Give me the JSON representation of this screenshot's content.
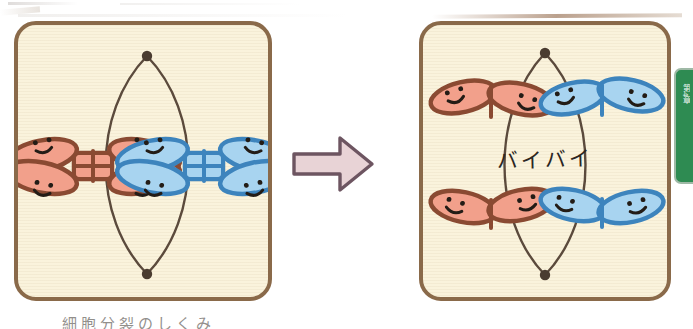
{
  "figure": {
    "title_text": "",
    "caption_bottom": "細胞分裂のしくみ",
    "arrow_label": "transition-arrow"
  },
  "colors": {
    "panel_background": "#faf3dc",
    "panel_border": "#8a6a4a",
    "red_chromosome_fill": "#f2a08b",
    "red_chromosome_stroke": "#8a4a32",
    "blue_chromosome_fill": "#a8d4f0",
    "blue_chromosome_stroke": "#3d84bd",
    "spindle_line": "#5b4a3c",
    "pole_dot": "#4a3c30",
    "face_stroke": "#231c16",
    "arrow_fill": "#e8d3d6",
    "arrow_stroke": "#6d5561",
    "page_tab_green": "#2e8b52",
    "bye_text": "#2b2622"
  },
  "panels": [
    {
      "id": "panel-left",
      "name": "metaphase-panel",
      "stage_label": "Metaphase — paired chromosomes aligned at the equator",
      "spindle": {
        "pole_top": [
          129,
          30
        ],
        "pole_bottom": [
          129,
          250
        ],
        "shape": "lens"
      },
      "chromosomes": [
        {
          "id": "left-red-chromosome",
          "color": "red",
          "shape": "X",
          "lobes": 4,
          "faces": 4,
          "center": [
            74,
            140
          ]
        },
        {
          "id": "left-blue-chromosome",
          "color": "blue",
          "shape": "X",
          "lobes": 4,
          "faces": 4,
          "center": [
            186,
            140
          ]
        }
      ]
    },
    {
      "id": "panel-right",
      "name": "anaphase-panel",
      "stage_label": "Anaphase — sister chromatids pulled apart toward the poles",
      "caption": "バイバイ",
      "spindle": {
        "pole_top": [
          126,
          26
        ],
        "pole_bottom": [
          126,
          252
        ],
        "shape": "lens"
      },
      "chromosomes": [
        {
          "id": "right-red-chromosome-top",
          "color": "red",
          "shape": "V",
          "lobes": 2,
          "faces": 2,
          "center": [
            70,
            83
          ]
        },
        {
          "id": "right-blue-chromosome-top",
          "color": "blue",
          "shape": "V",
          "lobes": 2,
          "faces": 2,
          "center": [
            184,
            83
          ]
        },
        {
          "id": "right-red-chromosome-bottom",
          "color": "red",
          "shape": "V",
          "lobes": 2,
          "faces": 2,
          "center": [
            70,
            185
          ]
        },
        {
          "id": "right-blue-chromosome-bottom",
          "color": "blue",
          "shape": "V",
          "lobes": 2,
          "faces": 2,
          "center": [
            184,
            185
          ]
        }
      ]
    }
  ],
  "page_tab": {
    "label": "第4章",
    "color": "#2e8b52"
  }
}
